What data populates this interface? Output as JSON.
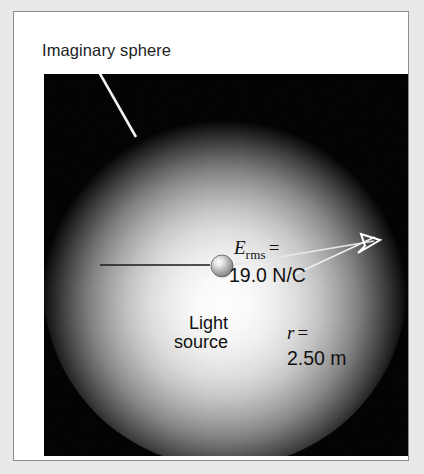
{
  "figure": {
    "caption": "Imaginary sphere",
    "panel_background": "#000000",
    "frame_border_color": "#8e8e8e",
    "page_background": "#e9e9e9"
  },
  "labels": {
    "field_symbol": "E",
    "field_subscript": "rms",
    "field_equals": "=",
    "field_value": "19.0 N/C",
    "source_line1": "Light",
    "source_line2": "source",
    "radius_symbol": "r",
    "radius_equals": "=",
    "radius_value": "2.50 m"
  },
  "icons": {
    "light_source": "light-source-sphere-icon",
    "arrow": "radius-arrow-icon",
    "leader": "leader-line-icon"
  },
  "physics": {
    "rms_electric_field_N_per_C": 19.0,
    "radius_m": 2.5
  }
}
